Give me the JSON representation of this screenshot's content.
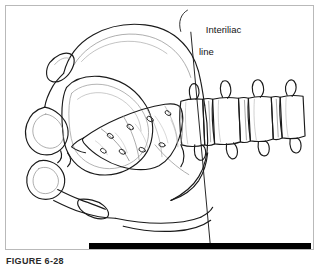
{
  "figure": {
    "caption": "FIGURE 6-28",
    "scale_bar": {
      "name": "scale-bar",
      "color": "#000000"
    },
    "frame_color": "#b9b9b9",
    "background_color": "#ffffff",
    "ink_color": "#1a1a1a"
  },
  "annotations": [
    {
      "id": "interiliac-line",
      "label_line_1": "Interiliac",
      "label_line_2": "line"
    }
  ],
  "illustration": {
    "subject": "pelvis-and-lumbar-spine-line-drawing",
    "parts": [
      "iliac-crest",
      "ilium",
      "sacrum",
      "sacral-foramina",
      "obturator-foramen",
      "pubis",
      "ischium",
      "lumbar-vertebrae",
      "transverse-processes"
    ]
  }
}
